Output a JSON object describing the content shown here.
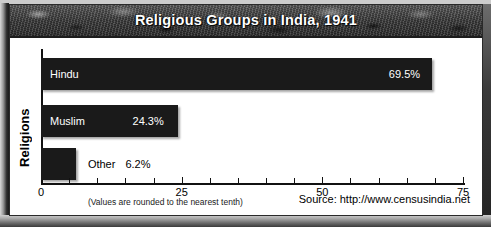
{
  "chart_data": {
    "type": "bar",
    "orientation": "horizontal",
    "title": "Religious Groups in India, 1941",
    "xlabel": "",
    "ylabel": "Religions",
    "categories": [
      "Hindu",
      "Muslim",
      "Other"
    ],
    "values": [
      69.5,
      24.3,
      6.2
    ],
    "value_labels": [
      "69.5%",
      "24.3%",
      "6.2%"
    ],
    "xlim": [
      0,
      75
    ],
    "major_ticks": [
      0,
      25,
      50,
      75
    ],
    "major_tick_labels": [
      "0",
      "25",
      "50",
      "75"
    ],
    "minor_tick_step": 5,
    "grid": false,
    "legend": false,
    "bar_color": "#1a1a1a",
    "note": "(Values are rounded to the nearest tenth)",
    "source": "Source: http://www.censusindia.net"
  },
  "footer": {
    "note": "(Values are rounded to the nearest tenth)",
    "source": "Source: http://www.censusindia.net"
  }
}
